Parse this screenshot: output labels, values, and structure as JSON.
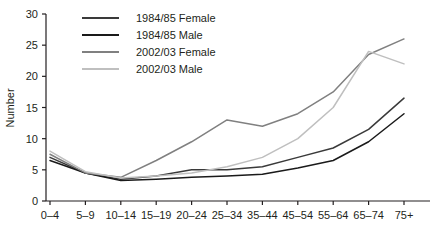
{
  "chart_data": {
    "type": "line",
    "title": "",
    "xlabel": "",
    "ylabel": "Number",
    "ylim": [
      0,
      30
    ],
    "yticks": [
      0,
      5,
      10,
      15,
      20,
      25,
      30
    ],
    "grid": false,
    "legend_position": "top-left-inside",
    "categories": [
      "0–4",
      "5–9",
      "10–14",
      "15–19",
      "20–24",
      "25–34",
      "35–44",
      "45–54",
      "55–64",
      "65–74",
      "75+"
    ],
    "series": [
      {
        "name": "1984/85 Female",
        "color": "#3a3a3a",
        "values": [
          7,
          4.5,
          3.5,
          4,
          5,
          5,
          5.5,
          7,
          8.5,
          11.5,
          16.5
        ]
      },
      {
        "name": "1984/85 Male",
        "color": "#1a1a1a",
        "values": [
          6.5,
          4.5,
          3.3,
          3.5,
          3.8,
          4,
          4.3,
          5.3,
          6.5,
          9.5,
          14
        ]
      },
      {
        "name": "2002/03 Female",
        "color": "#808080",
        "values": [
          7.5,
          4.5,
          3.8,
          6.5,
          9.5,
          13,
          12,
          14,
          17.5,
          23.5,
          26
        ]
      },
      {
        "name": "2002/03 Male",
        "color": "#bfbfbf",
        "values": [
          8,
          4.7,
          3.7,
          4,
          4.5,
          5.5,
          7,
          10,
          15,
          24,
          22
        ]
      }
    ]
  },
  "axis": {
    "y_title": "Number",
    "y_tick_labels": [
      "0",
      "5",
      "10",
      "15",
      "20",
      "25",
      "30"
    ],
    "x_tick_labels": [
      "0–4",
      "5–9",
      "10–14",
      "15–19",
      "20–24",
      "25–34",
      "35–44",
      "45–54",
      "55–64",
      "65–74",
      "75+"
    ]
  },
  "legend": {
    "entries": [
      {
        "label": "1984/85 Female",
        "color": "#3a3a3a"
      },
      {
        "label": "1984/85 Male",
        "color": "#1a1a1a"
      },
      {
        "label": "2002/03 Female",
        "color": "#808080"
      },
      {
        "label": "2002/03 Male",
        "color": "#bfbfbf"
      }
    ]
  }
}
